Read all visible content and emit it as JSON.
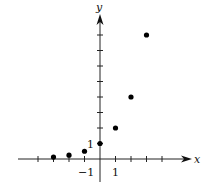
{
  "chart_data": {
    "type": "scatter",
    "title": "",
    "xlabel": "x",
    "ylabel": "y",
    "x": [
      -3,
      -2,
      -1,
      0,
      1,
      2,
      3
    ],
    "y": [
      0.125,
      0.25,
      0.5,
      1,
      2,
      4,
      8
    ],
    "series": [
      {
        "name": "points",
        "x": [
          -3,
          -2,
          -1,
          0,
          1,
          2,
          3
        ],
        "y": [
          0.125,
          0.25,
          0.5,
          1,
          2,
          4,
          8
        ]
      }
    ],
    "xlim": [
      -5,
      5
    ],
    "ylim": [
      -1,
      9
    ],
    "x_ticks": [
      -4,
      -3,
      -2,
      -1,
      1,
      2,
      3,
      4
    ],
    "y_ticks": [
      1,
      2,
      3,
      4,
      5,
      6,
      7,
      8
    ],
    "x_tick_labels": [
      {
        "value": -1,
        "label": "−1"
      },
      {
        "value": 1,
        "label": "1"
      }
    ],
    "y_tick_labels": [
      {
        "value": 1,
        "label": "1"
      }
    ],
    "grid": false,
    "legend": null
  },
  "axes": {
    "x_label": "x",
    "y_label": "y",
    "x_tick_neg1": "−1",
    "x_tick_1": "1",
    "y_tick_1": "1"
  }
}
